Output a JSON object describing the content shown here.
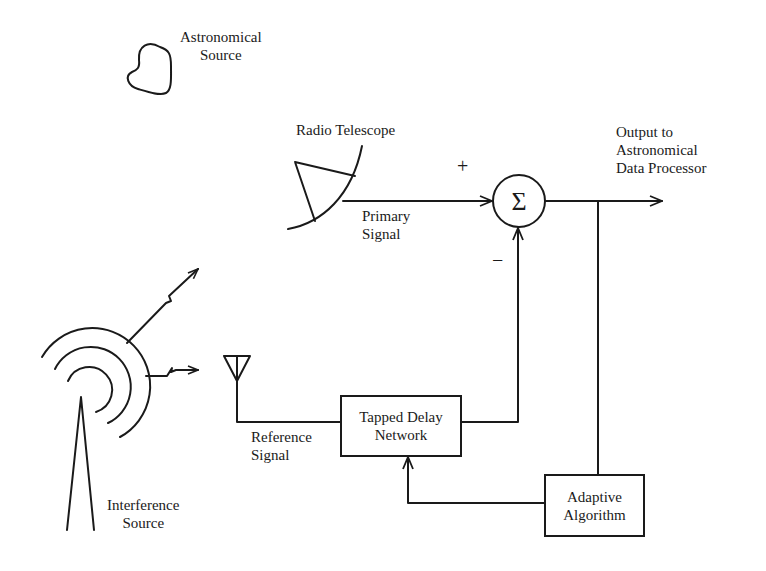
{
  "diagram": {
    "type": "block-diagram",
    "nodes": {
      "astronomical_source": {
        "label_lines": [
          "Astronomical",
          "Source"
        ]
      },
      "radio_telescope": {
        "label": "Radio Telescope"
      },
      "interference_source": {
        "label_lines": [
          "Interference",
          "Source"
        ]
      },
      "summer": {
        "symbol": "Σ",
        "plus_sign": "+",
        "minus_sign": "−"
      },
      "tapped_delay_network": {
        "label_lines": [
          "Tapped Delay",
          "Network"
        ]
      },
      "adaptive_algorithm": {
        "label_lines": [
          "Adaptive",
          "Algorithm"
        ]
      },
      "output": {
        "label_lines": [
          "Output to",
          "Astronomical",
          "Data Processor"
        ]
      }
    },
    "signals": {
      "primary": {
        "label_lines": [
          "Primary",
          "Signal"
        ]
      },
      "reference": {
        "label_lines": [
          "Reference",
          "Signal"
        ]
      }
    },
    "edges": [
      {
        "from": "radio_telescope",
        "to": "summer",
        "label": "Primary Signal",
        "sign": "+"
      },
      {
        "from": "tapped_delay_network",
        "to": "summer",
        "sign": "−"
      },
      {
        "from": "summer",
        "to": "output"
      },
      {
        "from": "summer",
        "to": "adaptive_algorithm"
      },
      {
        "from": "adaptive_algorithm",
        "to": "tapped_delay_network"
      },
      {
        "from": "reference_antenna",
        "to": "tapped_delay_network",
        "label": "Reference Signal"
      },
      {
        "from": "interference_source",
        "to": "radio_telescope",
        "style": "lightning"
      },
      {
        "from": "interference_source",
        "to": "reference_antenna",
        "style": "lightning"
      }
    ]
  }
}
